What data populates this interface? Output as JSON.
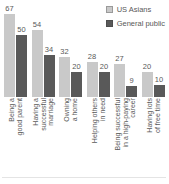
{
  "colors": {
    "us_asians_bar": "#c9c9c9",
    "general_public_bar": "#595959",
    "text": "#595959",
    "divider": "#e4e4e4"
  },
  "chart_data": {
    "type": "bar",
    "title": "",
    "categories": [
      "Being a good parent",
      "Having a successful marriage",
      "Owning a home",
      "Helping others in need",
      "Being successful in a high-paying career",
      "Having lots of free time"
    ],
    "category_lines": [
      [
        "Being a",
        "good parent"
      ],
      [
        "Having a",
        "successful",
        "marriage"
      ],
      [
        "Owning",
        "a home"
      ],
      [
        "Helping others",
        "in need"
      ],
      [
        "Being successful",
        "in a high-paying",
        "career"
      ],
      [
        "Having lots",
        "of free time"
      ]
    ],
    "series": [
      {
        "name": "US Asians",
        "color": "#c9c9c9",
        "values": [
          67,
          54,
          32,
          28,
          27,
          20
        ]
      },
      {
        "name": "General public",
        "color": "#595959",
        "values": [
          50,
          34,
          20,
          20,
          9,
          10
        ]
      }
    ],
    "value_labels": true,
    "grid": false,
    "ylim": [
      0,
      100
    ],
    "legend_position": "top-right"
  }
}
